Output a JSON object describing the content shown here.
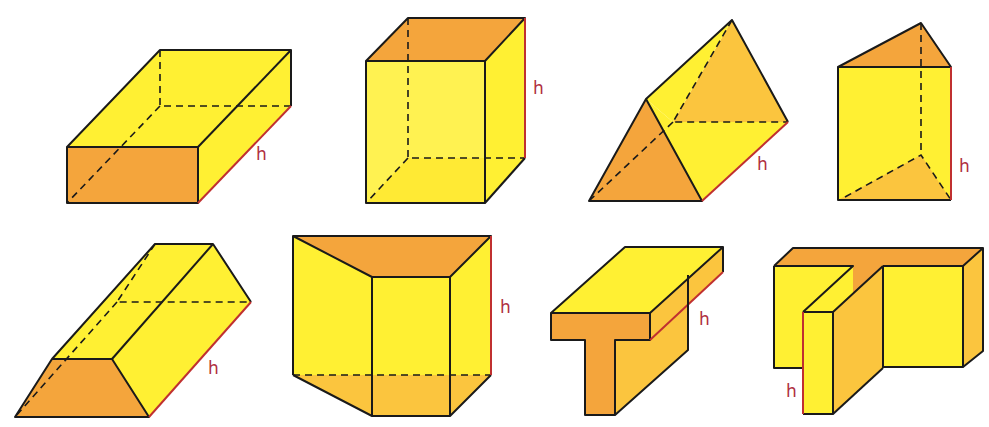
{
  "figure": {
    "height_label": "h",
    "colors": {
      "yellow": "#fff033",
      "orange": "#f4a53c",
      "light_orange": "#fbc53e",
      "edge": "#1a1a1a",
      "height_marker": "#c03030"
    },
    "shapes": [
      {
        "name": "rectangular-prism-lying",
        "label": "h"
      },
      {
        "name": "rectangular-prism-upright",
        "label": "h"
      },
      {
        "name": "triangular-prism-lying",
        "label": "h"
      },
      {
        "name": "triangular-prism-upright",
        "label": "h"
      },
      {
        "name": "trapezoidal-prism-lying",
        "label": "h"
      },
      {
        "name": "trapezoidal-prism-upright",
        "label": "h"
      },
      {
        "name": "t-shaped-prism-lying",
        "label": "h"
      },
      {
        "name": "t-shaped-prism-upright",
        "label": "h"
      }
    ]
  }
}
